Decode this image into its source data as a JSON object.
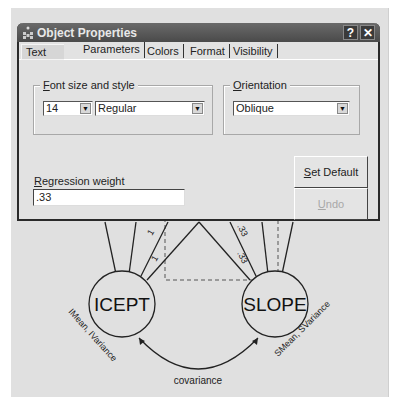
{
  "dialog": {
    "title": "Object Properties",
    "help_button": "?",
    "close_button": "✕",
    "tabs": [
      {
        "label": "Text",
        "active": false
      },
      {
        "label": "Parameters",
        "active": true
      },
      {
        "label": "Colors",
        "active": false
      },
      {
        "label": "Format",
        "active": false
      },
      {
        "label": "Visibility",
        "active": false
      }
    ],
    "font_group": {
      "label_prefix": "F",
      "label_rest": "ont size and style",
      "size_value": "14",
      "style_value": "Regular"
    },
    "orientation_group": {
      "label_prefix": "O",
      "label_rest": "rientation",
      "value": "Oblique"
    },
    "regression_weight": {
      "label_prefix": "R",
      "label_rest": "egression weight",
      "value": ".33"
    },
    "set_default_button": {
      "prefix": "S",
      "rest": "et Default"
    },
    "undo_button": {
      "prefix": "U",
      "rest": "ndo",
      "disabled": true
    }
  },
  "diagram": {
    "nodes": [
      {
        "id": "icept",
        "label": "ICEPT",
        "sublabel": "IMean, IVariance"
      },
      {
        "id": "slope",
        "label": "SLOPE",
        "sublabel": "SMean, SVariance"
      }
    ],
    "path_labels": {
      "left_upper": "1",
      "left_lower": "1",
      "right_upper": ".33",
      "right_lower": ".33"
    },
    "covariance_label": "covariance"
  }
}
